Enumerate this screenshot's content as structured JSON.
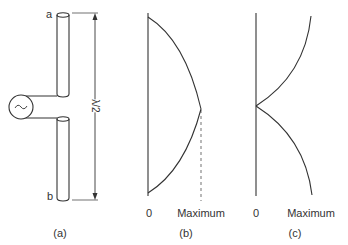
{
  "figure": {
    "panel_a": {
      "caption": "(a)",
      "end_top_label": "a",
      "end_bottom_label": "b",
      "dimension_label": "λ/2",
      "source_symbol": "~"
    },
    "panel_b": {
      "caption": "(b)",
      "axis_zero": "0",
      "axis_max": "Maximum"
    },
    "panel_c": {
      "caption": "(c)",
      "axis_zero": "0",
      "axis_max": "Maximum"
    }
  },
  "colors": {
    "stroke": "#333333",
    "background": "#ffffff"
  }
}
